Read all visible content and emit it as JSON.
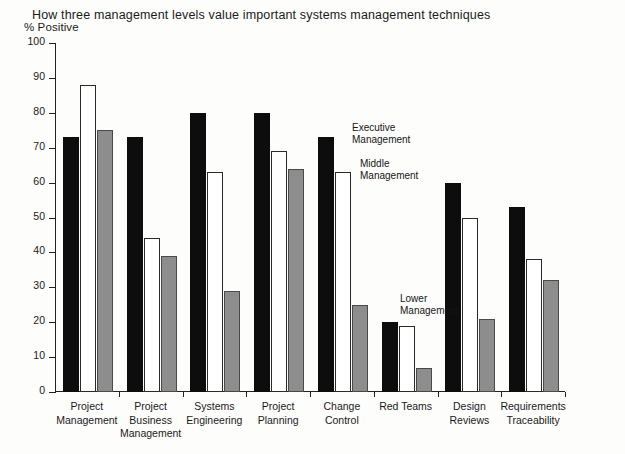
{
  "chart_data": {
    "type": "bar",
    "title": "How three management levels value important systems management techniques",
    "xlabel": "",
    "ylabel": "% Positive",
    "ylim": [
      0,
      100
    ],
    "yticks": [
      0,
      10,
      20,
      30,
      40,
      50,
      60,
      70,
      80,
      90,
      100
    ],
    "grid": false,
    "legend_position": "inline-annotations",
    "categories": [
      "Project\nManagement",
      "Project\nBusiness\nManagement",
      "Systems\nEngineering",
      "Project\nPlanning",
      "Change\nControl",
      "Red Teams",
      "Design\nReviews",
      "Requirements\nTraceability"
    ],
    "series": [
      {
        "name": "Executive Management",
        "color": "#0d0d0d",
        "values": [
          73,
          73,
          80,
          80,
          73,
          20,
          60,
          53
        ]
      },
      {
        "name": "Middle Management",
        "color": "#ffffff",
        "values": [
          88,
          44,
          63,
          69,
          63,
          19,
          50,
          38
        ]
      },
      {
        "name": "Lower Management",
        "color": "#8d8d8d",
        "values": [
          75,
          39,
          29,
          64,
          25,
          7,
          21,
          32
        ]
      }
    ],
    "annotations": [
      {
        "text": "Executive\nManagement",
        "x": 352,
        "y": 122
      },
      {
        "text": "Middle\nManagement",
        "x": 360,
        "y": 158
      },
      {
        "text": "Lower\nManagement",
        "x": 400,
        "y": 293
      }
    ]
  }
}
